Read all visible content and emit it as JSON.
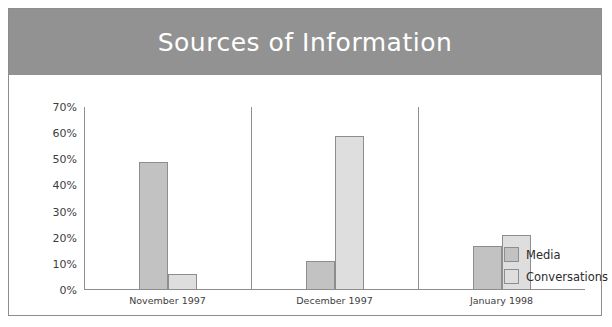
{
  "chart_data": {
    "type": "bar",
    "title": "Sources of Information",
    "xlabel": "",
    "ylabel": "",
    "ylim": [
      0,
      70
    ],
    "ytick_labels": [
      "0%",
      "10%",
      "20%",
      "30%",
      "40%",
      "50%",
      "60%",
      "70%"
    ],
    "ytick_values": [
      0,
      10,
      20,
      30,
      40,
      50,
      60,
      70
    ],
    "grid": false,
    "legend_position": "right",
    "categories": [
      "November 1997",
      "December 1997",
      "January  1998"
    ],
    "series": [
      {
        "name": "Media",
        "values": [
          49,
          11,
          17
        ],
        "color": "#c2c2c2"
      },
      {
        "name": "Conversations",
        "values": [
          6,
          59,
          21
        ],
        "color": "#dedede"
      }
    ]
  },
  "colors": {
    "title_band": "#929292",
    "title_text": "#ffffff",
    "axis": "#8d8d8d",
    "media": "#c2c2c2",
    "conversations": "#dedede",
    "frame": "#8d8d8d",
    "background": "#ffffff"
  }
}
